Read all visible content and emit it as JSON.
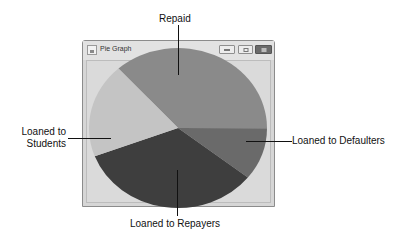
{
  "window": {
    "title": "Pie Graph",
    "icon": "java-app-icon",
    "controls": [
      "minimize",
      "maximize",
      "close"
    ]
  },
  "chart_data": {
    "type": "pie",
    "title": "Pie Graph",
    "categories": [
      "Repaid",
      "Loaned to Defaulters",
      "Loaned to Repayers",
      "Loaned to Students"
    ],
    "values": [
      36.7,
      10.6,
      33.6,
      19.1
    ],
    "colors": [
      "#8a8a8a",
      "#6a6a6a",
      "#3e3e3e",
      "#c4c4c4"
    ],
    "start_angle_deg": -132,
    "direction": "clockwise",
    "legend": "none",
    "annotations": [
      {
        "text": "Repaid",
        "position": "top"
      },
      {
        "text": "Loaned to Defaulters",
        "position": "right"
      },
      {
        "text": "Loaned to Repayers",
        "position": "bottom"
      },
      {
        "text": "Loaned to Students",
        "position": "left"
      }
    ]
  },
  "labels": {
    "repaid": "Repaid",
    "defaulters": "Loaned to Defaulters",
    "repayers": "Loaned to Repayers",
    "students_line1": "Loaned to",
    "students_line2": "Students"
  }
}
